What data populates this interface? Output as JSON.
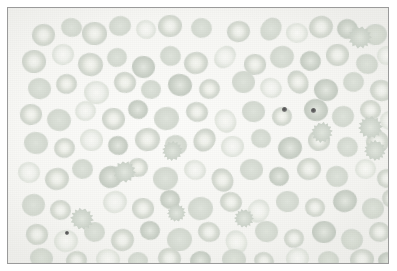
{
  "image": {
    "kind": "micrograph",
    "subject": "peripheral-blood-smear",
    "stain": "Wright-Giemsa",
    "frame": {
      "border_color": "#9a9a9a",
      "border_width_px": 1,
      "outer_margin_color": "#ffffff",
      "inset_left_px": 7,
      "inset_top_px": 7,
      "width_px": 382,
      "height_px": 257
    },
    "palette": {
      "background": "#fbfbf9",
      "rbc_membrane": "#cbd1c9",
      "rbc_pallor": "#f4f5f1",
      "platelet": "#4d4d4d"
    },
    "counts": {
      "erythrocytes": 118,
      "echinocytes": 9,
      "platelets": 3
    }
  },
  "cells": {
    "erythrocytes": [
      {
        "x": 24,
        "y": 16,
        "w": 23,
        "h": 22,
        "r": -8,
        "t": "disc"
      },
      {
        "x": 53,
        "y": 10,
        "w": 21,
        "h": 19,
        "r": 12,
        "t": "flat"
      },
      {
        "x": 74,
        "y": 14,
        "w": 25,
        "h": 23,
        "r": 4,
        "t": "disc"
      },
      {
        "x": 101,
        "y": 8,
        "w": 22,
        "h": 20,
        "r": -14,
        "t": "flat"
      },
      {
        "x": 128,
        "y": 12,
        "w": 20,
        "h": 19,
        "r": 20,
        "t": "pale"
      },
      {
        "x": 150,
        "y": 7,
        "w": 24,
        "h": 22,
        "r": -6,
        "t": "disc"
      },
      {
        "x": 183,
        "y": 10,
        "w": 21,
        "h": 20,
        "r": 9,
        "t": "flat"
      },
      {
        "x": 219,
        "y": 13,
        "w": 23,
        "h": 21,
        "r": -11,
        "t": "disc"
      },
      {
        "x": 253,
        "y": 9,
        "w": 20,
        "h": 24,
        "r": 34,
        "t": "flat"
      },
      {
        "x": 278,
        "y": 15,
        "w": 22,
        "h": 20,
        "r": 6,
        "t": "pale"
      },
      {
        "x": 301,
        "y": 8,
        "w": 24,
        "h": 22,
        "r": -18,
        "t": "disc"
      },
      {
        "x": 329,
        "y": 11,
        "w": 21,
        "h": 20,
        "r": 15,
        "t": "dark"
      },
      {
        "x": 356,
        "y": 16,
        "w": 23,
        "h": 21,
        "r": -5,
        "t": "flat"
      },
      {
        "x": 14,
        "y": 42,
        "w": 24,
        "h": 23,
        "r": 3,
        "t": "disc"
      },
      {
        "x": 44,
        "y": 36,
        "w": 22,
        "h": 21,
        "r": -9,
        "t": "pale"
      },
      {
        "x": 70,
        "y": 45,
        "w": 25,
        "h": 23,
        "r": 11,
        "t": "disc"
      },
      {
        "x": 99,
        "y": 40,
        "w": 20,
        "h": 19,
        "r": -20,
        "t": "flat"
      },
      {
        "x": 124,
        "y": 48,
        "w": 23,
        "h": 22,
        "r": 7,
        "t": "dark"
      },
      {
        "x": 152,
        "y": 38,
        "w": 21,
        "h": 20,
        "r": 17,
        "t": "flat"
      },
      {
        "x": 176,
        "y": 44,
        "w": 24,
        "h": 22,
        "r": -12,
        "t": "disc"
      },
      {
        "x": 207,
        "y": 37,
        "w": 20,
        "h": 24,
        "r": 40,
        "t": "pale"
      },
      {
        "x": 236,
        "y": 46,
        "w": 22,
        "h": 21,
        "r": 5,
        "t": "disc"
      },
      {
        "x": 262,
        "y": 38,
        "w": 24,
        "h": 22,
        "r": -16,
        "t": "flat"
      },
      {
        "x": 292,
        "y": 43,
        "w": 21,
        "h": 20,
        "r": 13,
        "t": "dark"
      },
      {
        "x": 318,
        "y": 36,
        "w": 23,
        "h": 22,
        "r": -4,
        "t": "disc"
      },
      {
        "x": 348,
        "y": 46,
        "w": 22,
        "h": 20,
        "r": 22,
        "t": "flat"
      },
      {
        "x": 369,
        "y": 38,
        "w": 20,
        "h": 19,
        "r": -8,
        "t": "pale"
      },
      {
        "x": 20,
        "y": 70,
        "w": 23,
        "h": 21,
        "r": 9,
        "t": "flat"
      },
      {
        "x": 48,
        "y": 66,
        "w": 21,
        "h": 20,
        "r": -14,
        "t": "disc"
      },
      {
        "x": 76,
        "y": 73,
        "w": 25,
        "h": 23,
        "r": 6,
        "t": "pale"
      },
      {
        "x": 106,
        "y": 64,
        "w": 22,
        "h": 21,
        "r": 18,
        "t": "disc"
      },
      {
        "x": 133,
        "y": 72,
        "w": 20,
        "h": 19,
        "r": -7,
        "t": "flat"
      },
      {
        "x": 160,
        "y": 66,
        "w": 24,
        "h": 22,
        "r": 11,
        "t": "dark"
      },
      {
        "x": 191,
        "y": 71,
        "w": 21,
        "h": 20,
        "r": -19,
        "t": "disc"
      },
      {
        "x": 224,
        "y": 63,
        "w": 23,
        "h": 22,
        "r": 4,
        "t": "flat"
      },
      {
        "x": 252,
        "y": 70,
        "w": 22,
        "h": 20,
        "r": 25,
        "t": "pale"
      },
      {
        "x": 280,
        "y": 62,
        "w": 20,
        "h": 24,
        "r": -30,
        "t": "disc"
      },
      {
        "x": 306,
        "y": 71,
        "w": 24,
        "h": 22,
        "r": 8,
        "t": "dark"
      },
      {
        "x": 335,
        "y": 64,
        "w": 21,
        "h": 20,
        "r": -11,
        "t": "flat"
      },
      {
        "x": 362,
        "y": 72,
        "w": 23,
        "h": 21,
        "r": 16,
        "t": "disc"
      },
      {
        "x": 12,
        "y": 96,
        "w": 22,
        "h": 21,
        "r": -6,
        "t": "disc"
      },
      {
        "x": 39,
        "y": 101,
        "w": 24,
        "h": 22,
        "r": 12,
        "t": "flat"
      },
      {
        "x": 67,
        "y": 93,
        "w": 21,
        "h": 20,
        "r": -17,
        "t": "pale"
      },
      {
        "x": 94,
        "y": 100,
        "w": 23,
        "h": 22,
        "r": 5,
        "t": "disc"
      },
      {
        "x": 120,
        "y": 92,
        "w": 20,
        "h": 19,
        "r": 21,
        "t": "dark"
      },
      {
        "x": 146,
        "y": 99,
        "w": 25,
        "h": 23,
        "r": -9,
        "t": "flat"
      },
      {
        "x": 178,
        "y": 94,
        "w": 22,
        "h": 20,
        "r": 14,
        "t": "disc"
      },
      {
        "x": 207,
        "y": 101,
        "w": 21,
        "h": 24,
        "r": -26,
        "t": "pale"
      },
      {
        "x": 234,
        "y": 93,
        "w": 23,
        "h": 21,
        "r": 7,
        "t": "flat"
      },
      {
        "x": 264,
        "y": 99,
        "w": 20,
        "h": 19,
        "r": -13,
        "t": "disc"
      },
      {
        "x": 296,
        "y": 91,
        "w": 24,
        "h": 22,
        "r": 10,
        "t": "dark"
      },
      {
        "x": 324,
        "y": 98,
        "w": 22,
        "h": 21,
        "r": -20,
        "t": "flat"
      },
      {
        "x": 352,
        "y": 92,
        "w": 21,
        "h": 20,
        "r": 6,
        "t": "disc"
      },
      {
        "x": 372,
        "y": 103,
        "w": 20,
        "h": 19,
        "r": 15,
        "t": "pale"
      },
      {
        "x": 16,
        "y": 124,
        "w": 24,
        "h": 22,
        "r": 8,
        "t": "flat"
      },
      {
        "x": 46,
        "y": 130,
        "w": 21,
        "h": 20,
        "r": -15,
        "t": "disc"
      },
      {
        "x": 72,
        "y": 121,
        "w": 23,
        "h": 22,
        "r": 3,
        "t": "pale"
      },
      {
        "x": 100,
        "y": 128,
        "w": 20,
        "h": 19,
        "r": 19,
        "t": "dark"
      },
      {
        "x": 127,
        "y": 120,
        "w": 25,
        "h": 23,
        "r": -8,
        "t": "disc"
      },
      {
        "x": 157,
        "y": 127,
        "w": 22,
        "h": 20,
        "r": 12,
        "t": "flat"
      },
      {
        "x": 186,
        "y": 120,
        "w": 21,
        "h": 24,
        "r": 36,
        "t": "disc"
      },
      {
        "x": 213,
        "y": 128,
        "w": 23,
        "h": 21,
        "r": -5,
        "t": "pale"
      },
      {
        "x": 243,
        "y": 121,
        "w": 20,
        "h": 19,
        "r": 17,
        "t": "flat"
      },
      {
        "x": 270,
        "y": 129,
        "w": 24,
        "h": 22,
        "r": -11,
        "t": "dark"
      },
      {
        "x": 300,
        "y": 122,
        "w": 22,
        "h": 21,
        "r": 4,
        "t": "disc"
      },
      {
        "x": 329,
        "y": 129,
        "w": 21,
        "h": 20,
        "r": 23,
        "t": "flat"
      },
      {
        "x": 358,
        "y": 123,
        "w": 23,
        "h": 22,
        "r": -7,
        "t": "disc"
      },
      {
        "x": 10,
        "y": 154,
        "w": 22,
        "h": 21,
        "r": 10,
        "t": "pale"
      },
      {
        "x": 37,
        "y": 160,
        "w": 24,
        "h": 22,
        "r": -13,
        "t": "disc"
      },
      {
        "x": 64,
        "y": 151,
        "w": 21,
        "h": 20,
        "r": 6,
        "t": "flat"
      },
      {
        "x": 91,
        "y": 158,
        "w": 23,
        "h": 22,
        "r": -18,
        "t": "dark"
      },
      {
        "x": 120,
        "y": 150,
        "w": 20,
        "h": 19,
        "r": 9,
        "t": "disc"
      },
      {
        "x": 145,
        "y": 159,
        "w": 25,
        "h": 23,
        "r": -4,
        "t": "flat"
      },
      {
        "x": 176,
        "y": 152,
        "w": 22,
        "h": 20,
        "r": 16,
        "t": "pale"
      },
      {
        "x": 204,
        "y": 160,
        "w": 21,
        "h": 24,
        "r": -28,
        "t": "disc"
      },
      {
        "x": 232,
        "y": 151,
        "w": 23,
        "h": 21,
        "r": 5,
        "t": "flat"
      },
      {
        "x": 261,
        "y": 159,
        "w": 20,
        "h": 19,
        "r": 20,
        "t": "dark"
      },
      {
        "x": 289,
        "y": 150,
        "w": 24,
        "h": 22,
        "r": -9,
        "t": "disc"
      },
      {
        "x": 318,
        "y": 158,
        "w": 22,
        "h": 21,
        "r": 13,
        "t": "flat"
      },
      {
        "x": 347,
        "y": 151,
        "w": 21,
        "h": 20,
        "r": -6,
        "t": "pale"
      },
      {
        "x": 369,
        "y": 161,
        "w": 20,
        "h": 19,
        "r": 11,
        "t": "disc"
      },
      {
        "x": 14,
        "y": 186,
        "w": 23,
        "h": 22,
        "r": -12,
        "t": "flat"
      },
      {
        "x": 42,
        "y": 192,
        "w": 21,
        "h": 20,
        "r": 7,
        "t": "disc"
      },
      {
        "x": 95,
        "y": 183,
        "w": 24,
        "h": 22,
        "r": -16,
        "t": "pale"
      },
      {
        "x": 124,
        "y": 190,
        "w": 22,
        "h": 21,
        "r": 4,
        "t": "disc"
      },
      {
        "x": 152,
        "y": 182,
        "w": 20,
        "h": 19,
        "r": 18,
        "t": "dark"
      },
      {
        "x": 180,
        "y": 189,
        "w": 25,
        "h": 23,
        "r": -8,
        "t": "flat"
      },
      {
        "x": 212,
        "y": 184,
        "w": 22,
        "h": 20,
        "r": 14,
        "t": "disc"
      },
      {
        "x": 240,
        "y": 191,
        "w": 21,
        "h": 24,
        "r": 32,
        "t": "pale"
      },
      {
        "x": 268,
        "y": 183,
        "w": 23,
        "h": 21,
        "r": -5,
        "t": "flat"
      },
      {
        "x": 297,
        "y": 190,
        "w": 20,
        "h": 19,
        "r": 10,
        "t": "disc"
      },
      {
        "x": 325,
        "y": 182,
        "w": 24,
        "h": 22,
        "r": -19,
        "t": "dark"
      },
      {
        "x": 354,
        "y": 190,
        "w": 22,
        "h": 21,
        "r": 6,
        "t": "flat"
      },
      {
        "x": 374,
        "y": 181,
        "w": 20,
        "h": 19,
        "r": 15,
        "t": "disc"
      },
      {
        "x": 18,
        "y": 216,
        "w": 22,
        "h": 21,
        "r": 9,
        "t": "disc"
      },
      {
        "x": 46,
        "y": 222,
        "w": 24,
        "h": 22,
        "r": -10,
        "t": "pale"
      },
      {
        "x": 76,
        "y": 214,
        "w": 21,
        "h": 20,
        "r": 5,
        "t": "flat"
      },
      {
        "x": 103,
        "y": 221,
        "w": 23,
        "h": 22,
        "r": -21,
        "t": "disc"
      },
      {
        "x": 132,
        "y": 213,
        "w": 20,
        "h": 19,
        "r": 12,
        "t": "dark"
      },
      {
        "x": 159,
        "y": 220,
        "w": 25,
        "h": 23,
        "r": -6,
        "t": "flat"
      },
      {
        "x": 190,
        "y": 214,
        "w": 22,
        "h": 20,
        "r": 17,
        "t": "disc"
      },
      {
        "x": 218,
        "y": 222,
        "w": 21,
        "h": 24,
        "r": -24,
        "t": "pale"
      },
      {
        "x": 247,
        "y": 213,
        "w": 23,
        "h": 21,
        "r": 8,
        "t": "flat"
      },
      {
        "x": 276,
        "y": 221,
        "w": 20,
        "h": 19,
        "r": -14,
        "t": "disc"
      },
      {
        "x": 304,
        "y": 213,
        "w": 24,
        "h": 22,
        "r": 3,
        "t": "dark"
      },
      {
        "x": 333,
        "y": 221,
        "w": 22,
        "h": 21,
        "r": 20,
        "t": "flat"
      },
      {
        "x": 361,
        "y": 214,
        "w": 21,
        "h": 20,
        "r": -7,
        "t": "disc"
      },
      {
        "x": 22,
        "y": 240,
        "w": 23,
        "h": 20,
        "r": 6,
        "t": "flat"
      },
      {
        "x": 58,
        "y": 243,
        "w": 21,
        "h": 19,
        "r": -12,
        "t": "disc"
      },
      {
        "x": 88,
        "y": 241,
        "w": 24,
        "h": 21,
        "r": 10,
        "t": "pale"
      },
      {
        "x": 120,
        "y": 244,
        "w": 20,
        "h": 18,
        "r": -5,
        "t": "flat"
      },
      {
        "x": 150,
        "y": 240,
        "w": 23,
        "h": 21,
        "r": 15,
        "t": "disc"
      },
      {
        "x": 182,
        "y": 243,
        "w": 21,
        "h": 19,
        "r": -9,
        "t": "dark"
      },
      {
        "x": 214,
        "y": 241,
        "w": 24,
        "h": 21,
        "r": 4,
        "t": "flat"
      },
      {
        "x": 246,
        "y": 244,
        "w": 20,
        "h": 18,
        "r": 18,
        "t": "disc"
      },
      {
        "x": 278,
        "y": 240,
        "w": 23,
        "h": 21,
        "r": -11,
        "t": "pale"
      },
      {
        "x": 310,
        "y": 243,
        "w": 21,
        "h": 19,
        "r": 7,
        "t": "flat"
      },
      {
        "x": 342,
        "y": 241,
        "w": 24,
        "h": 21,
        "r": -6,
        "t": "disc"
      },
      {
        "x": 370,
        "y": 244,
        "w": 20,
        "h": 18,
        "r": 13,
        "t": "dark"
      }
    ],
    "echinocytes": [
      {
        "x": 340,
        "y": 18,
        "w": 24,
        "h": 23,
        "r": 12
      },
      {
        "x": 303,
        "y": 114,
        "w": 22,
        "h": 21,
        "r": -20
      },
      {
        "x": 350,
        "y": 108,
        "w": 25,
        "h": 23,
        "r": 8
      },
      {
        "x": 356,
        "y": 132,
        "w": 22,
        "h": 21,
        "r": 30
      },
      {
        "x": 105,
        "y": 153,
        "w": 23,
        "h": 22,
        "r": -9
      },
      {
        "x": 62,
        "y": 200,
        "w": 24,
        "h": 22,
        "r": 18
      },
      {
        "x": 154,
        "y": 133,
        "w": 21,
        "h": 20,
        "r": -25
      },
      {
        "x": 226,
        "y": 201,
        "w": 20,
        "h": 19,
        "r": 14
      },
      {
        "x": 159,
        "y": 196,
        "w": 19,
        "h": 18,
        "r": -16
      }
    ],
    "platelets": [
      {
        "x": 274,
        "y": 99,
        "d": 5
      },
      {
        "x": 303,
        "y": 100,
        "d": 5
      },
      {
        "x": 57,
        "y": 223,
        "d": 4
      }
    ]
  }
}
